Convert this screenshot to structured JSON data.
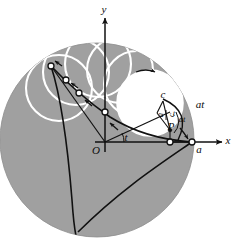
{
  "figure": {
    "colors": {
      "disk_fill": "#a0a0a0",
      "disk_edge": "#8f8f8f",
      "rolling_circle_stroke": "#ffffff",
      "rolling_circle_fill": "#ffffff",
      "curve_stroke": "#111111",
      "axis_stroke": "#111111",
      "background": "#ffffff",
      "marker_fill": "#ffffff",
      "marker_stroke": "#111111"
    },
    "axes": {
      "x_label": "x",
      "y_label": "y",
      "origin_label": "O"
    },
    "labels": [
      {
        "name": "y-axis-label",
        "text": "y",
        "x": 104,
        "y": 10,
        "size": "normal"
      },
      {
        "name": "x-axis-label",
        "text": "x",
        "x": 228,
        "y": 141,
        "size": "normal"
      },
      {
        "name": "origin-label",
        "text": "O",
        "x": 96,
        "y": 151,
        "size": "normal"
      },
      {
        "name": "angle-t-label",
        "text": "t",
        "x": 126,
        "y": 139,
        "size": "normal"
      },
      {
        "name": "point-a-label",
        "text": "a",
        "x": 198,
        "y": 150,
        "size": "normal"
      },
      {
        "name": "point-c-label",
        "text": "c",
        "x": 163,
        "y": 96,
        "size": "normal"
      },
      {
        "name": "point-P-label",
        "text": "P",
        "x": 170,
        "y": 127,
        "size": "normal"
      },
      {
        "name": "radius-a-over-c-num",
        "text": "a",
        "x": 166,
        "y": 110,
        "size": "small"
      },
      {
        "name": "radius-a-over-c-den",
        "text": "c",
        "x": 166,
        "y": 120,
        "size": "small"
      },
      {
        "name": "inner-at-label",
        "text": "at",
        "x": 180,
        "y": 119,
        "size": "small"
      },
      {
        "name": "outer-at-label",
        "text": "at",
        "x": 198,
        "y": 105,
        "size": "normal"
      },
      {
        "name": "arc-t-label",
        "text": "t",
        "x": 173,
        "y": 114,
        "size": "tiny"
      }
    ],
    "geometry": {
      "disk_center": [
        97,
        140
      ],
      "disk_radius": 97,
      "point_a": [
        192,
        142
      ],
      "rolling_circle_center": [
        150,
        103
      ],
      "rolling_circle_radius": 33,
      "marker_points": [
        [
          51,
          66
        ],
        [
          66,
          80
        ],
        [
          79,
          93
        ],
        [
          105,
          113
        ]
      ]
    },
    "markers": {
      "count": 4,
      "shape": "small-open-circle"
    },
    "arrows": {
      "direction_hint": "rolling / tangent direction indicators",
      "count": 6
    }
  }
}
